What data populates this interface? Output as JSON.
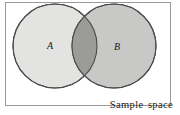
{
  "figure": {
    "type": "venn-diagram",
    "title": "",
    "frame": {
      "label": "Sample space",
      "border_color": "#9a9a9a",
      "background_color": "#ffffff",
      "x": 5,
      "y": 2,
      "width": 166,
      "height": 104
    },
    "sets": [
      {
        "id": "A",
        "label": "A",
        "fill_color": "#e3e3e1",
        "stroke_color": "#4a4a4a",
        "cx": 55,
        "cy": 46,
        "r": 42,
        "label_x": 50,
        "label_y": 46
      },
      {
        "id": "B",
        "label": "B",
        "fill_color": "#c8c8c6",
        "stroke_color": "#4a4a4a",
        "cx": 114,
        "cy": 46,
        "r": 42,
        "label_x": 117,
        "label_y": 47
      }
    ],
    "intersection": {
      "label": "",
      "fill_color": "#9b9b99",
      "description": "A and B overlap"
    }
  }
}
